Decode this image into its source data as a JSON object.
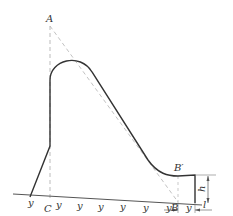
{
  "diagram": {
    "labels": {
      "A": "A",
      "B": "B",
      "B_prime": "B′",
      "C": "C",
      "h": "h",
      "l": "l"
    },
    "hatch_mark": "y",
    "colors": {
      "profile": "#333333",
      "construction": "#aaaaaa",
      "ground": "#555555"
    }
  }
}
